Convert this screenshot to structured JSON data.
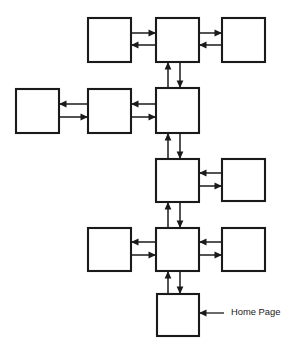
{
  "diagram": {
    "type": "site-map-flow-diagram",
    "canvas": {
      "width": 290,
      "height": 349
    },
    "style": {
      "background_color": "#ffffff",
      "box_fill": "#ffffff",
      "box_stroke": "#1a1a1a",
      "line_color": "#1a1a1a",
      "text_color": "#1a1a1a"
    },
    "nodes": [
      {
        "id": "r1-left",
        "label": "",
        "x": 88,
        "y": 18,
        "w": 43,
        "h": 44,
        "row": 1,
        "column": "left"
      },
      {
        "id": "r1-center",
        "label": "",
        "x": 156,
        "y": 18,
        "w": 43,
        "h": 44,
        "row": 1,
        "column": "center"
      },
      {
        "id": "r1-right",
        "label": "",
        "x": 222,
        "y": 18,
        "w": 43,
        "h": 44,
        "row": 1,
        "column": "right"
      },
      {
        "id": "r2-far-left",
        "label": "",
        "x": 16,
        "y": 89,
        "w": 43,
        "h": 44,
        "row": 2,
        "column": "far-left"
      },
      {
        "id": "r2-left",
        "label": "",
        "x": 88,
        "y": 89,
        "w": 43,
        "h": 44,
        "row": 2,
        "column": "left"
      },
      {
        "id": "r2-center",
        "label": "",
        "x": 156,
        "y": 88,
        "w": 43,
        "h": 45,
        "row": 2,
        "column": "center"
      },
      {
        "id": "r3-center",
        "label": "",
        "x": 156,
        "y": 159,
        "w": 43,
        "h": 43,
        "row": 3,
        "column": "center"
      },
      {
        "id": "r3-right",
        "label": "",
        "x": 222,
        "y": 159,
        "w": 43,
        "h": 42,
        "row": 3,
        "column": "right"
      },
      {
        "id": "r4-left",
        "label": "",
        "x": 88,
        "y": 228,
        "w": 43,
        "h": 43,
        "row": 4,
        "column": "left"
      },
      {
        "id": "r4-center",
        "label": "",
        "x": 156,
        "y": 228,
        "w": 43,
        "h": 43,
        "row": 4,
        "column": "center"
      },
      {
        "id": "r4-right",
        "label": "",
        "x": 222,
        "y": 228,
        "w": 43,
        "h": 43,
        "row": 4,
        "column": "right"
      },
      {
        "id": "r5-home",
        "label": "",
        "x": 157,
        "y": 294,
        "w": 42,
        "h": 42,
        "row": 5,
        "column": "center"
      }
    ],
    "links": [
      {
        "id": "link-r1-left-center",
        "from": "r1-left",
        "to": "r1-center",
        "orientation": "horizontal",
        "top_arrow": "right",
        "bottom_arrow": "left",
        "x1": 131,
        "x2": 156,
        "y_top": 33,
        "y_bottom": 45
      },
      {
        "id": "link-r1-center-right",
        "from": "r1-center",
        "to": "r1-right",
        "orientation": "horizontal",
        "top_arrow": "right",
        "bottom_arrow": "left",
        "x1": 199,
        "x2": 222,
        "y_top": 33,
        "y_bottom": 45
      },
      {
        "id": "link-r1-r2-vertical",
        "from": "r1-center",
        "to": "r2-center",
        "orientation": "vertical",
        "left_arrow": "up",
        "right_arrow": "down",
        "y1": 62,
        "y2": 88,
        "x_left": 168,
        "x_right": 180
      },
      {
        "id": "link-r2-farleft-left",
        "from": "r2-far-left",
        "to": "r2-left",
        "orientation": "horizontal",
        "top_arrow": "left",
        "bottom_arrow": "right",
        "x1": 59,
        "x2": 88,
        "y_top": 104,
        "y_bottom": 117
      },
      {
        "id": "link-r2-left-center",
        "from": "r2-left",
        "to": "r2-center",
        "orientation": "horizontal",
        "top_arrow": "left",
        "bottom_arrow": "right",
        "x1": 131,
        "x2": 156,
        "y_top": 104,
        "y_bottom": 117
      },
      {
        "id": "link-r2-r3-vertical",
        "from": "r2-center",
        "to": "r3-center",
        "orientation": "vertical",
        "left_arrow": "up",
        "right_arrow": "down",
        "y1": 133,
        "y2": 159,
        "x_left": 168,
        "x_right": 180
      },
      {
        "id": "link-r3-center-right",
        "from": "r3-center",
        "to": "r3-right",
        "orientation": "horizontal",
        "top_arrow": "left",
        "bottom_arrow": "right",
        "x1": 199,
        "x2": 222,
        "y_top": 173,
        "y_bottom": 186
      },
      {
        "id": "link-r3-r4-vertical",
        "from": "r3-center",
        "to": "r4-center",
        "orientation": "vertical",
        "left_arrow": "up",
        "right_arrow": "down",
        "y1": 202,
        "y2": 228,
        "x_left": 168,
        "x_right": 180
      },
      {
        "id": "link-r4-left-center",
        "from": "r4-left",
        "to": "r4-center",
        "orientation": "horizontal",
        "top_arrow": "left",
        "bottom_arrow": "right",
        "x1": 131,
        "x2": 156,
        "y_top": 242,
        "y_bottom": 255
      },
      {
        "id": "link-r4-center-right",
        "from": "r4-center",
        "to": "r4-right",
        "orientation": "horizontal",
        "top_arrow": "left",
        "bottom_arrow": "right",
        "x1": 199,
        "x2": 222,
        "y_top": 242,
        "y_bottom": 255
      },
      {
        "id": "link-r4-r5-vertical",
        "from": "r4-center",
        "to": "r5-home",
        "orientation": "vertical",
        "left_arrow": "up",
        "right_arrow": "down",
        "y1": 271,
        "y2": 294,
        "x_left": 168,
        "x_right": 180
      }
    ],
    "annotations": [
      {
        "id": "home-page-callout",
        "text": "Home Page",
        "target": "r5-home",
        "pointer_direction": "left",
        "line_x1": 224,
        "line_x2": 199,
        "line_y": 313,
        "text_x": 231,
        "text_y": 313
      }
    ]
  }
}
